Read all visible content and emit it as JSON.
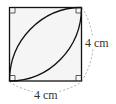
{
  "diagram": {
    "type": "geometry",
    "square": {
      "side_length_label": "4 cm",
      "fill_color": "#f5f5f5",
      "stroke_color": "#111111"
    },
    "labels": {
      "right_side": "4 cm",
      "bottom_side": "4 cm"
    },
    "dimension_line_color": "#999999",
    "arc_color": "#111111",
    "right_angle_marks": 4
  }
}
